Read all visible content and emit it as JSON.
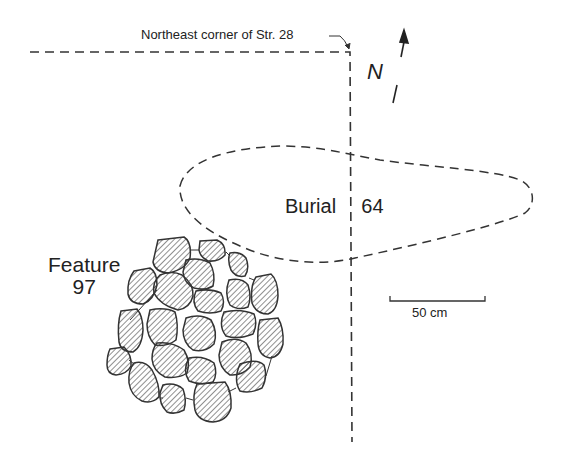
{
  "diagram": {
    "corner_label": "Northeast corner of Str. 28",
    "north_label": "N",
    "burial_label_word": "Burial",
    "burial_label_number": "64",
    "feature_label_word": "Feature",
    "feature_label_number": "97",
    "scale_label": "50 cm",
    "colors": {
      "line": "#333333",
      "stone_fill": "#ffffff",
      "hatch": "#444444",
      "background": "#ffffff"
    }
  }
}
